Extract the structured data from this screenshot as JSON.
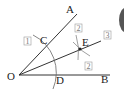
{
  "diagram": {
    "points": {
      "O": {
        "label": "O",
        "x": 6,
        "y": 79
      },
      "A": {
        "label": "A",
        "x": 68,
        "y": 11
      },
      "B": {
        "label": "B",
        "x": 102,
        "y": 83
      },
      "C": {
        "label": "C",
        "x": 41,
        "y": 41
      },
      "D": {
        "label": "D",
        "x": 56,
        "y": 84
      },
      "E": {
        "label": "E",
        "x": 82,
        "y": 45
      }
    },
    "step_labels": {
      "step1": "1",
      "step2a": "2",
      "step2b": "2",
      "step3": "3"
    },
    "colors": {
      "line": "#333333",
      "arc": "#666666",
      "box": "#888888"
    }
  }
}
